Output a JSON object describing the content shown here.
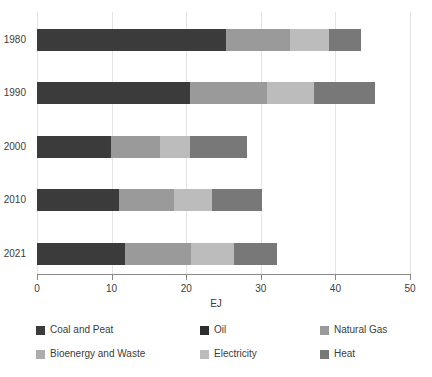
{
  "chart_data": {
    "type": "bar",
    "orientation": "horizontal",
    "stacked": true,
    "title": "",
    "xlabel": "EJ",
    "ylabel": "",
    "xlim": [
      0,
      50
    ],
    "xticks": [
      0,
      10,
      20,
      30,
      40,
      50
    ],
    "xtick_labels": [
      "0",
      "10",
      "20",
      "30",
      "40",
      "50"
    ],
    "categories": [
      "1980",
      "1990",
      "2000",
      "2010",
      "2021"
    ],
    "grid": "vertical",
    "legend_position": "bottom",
    "series": [
      {
        "name": "Coal and Peat",
        "color": "#3b3b3b",
        "values": [
          25.4,
          20.5,
          9.9,
          11.0,
          11.8
        ]
      },
      {
        "name": "Oil",
        "color": "#2e2e2e",
        "values": [
          0.0,
          0.0,
          0.0,
          0.0,
          0.0
        ]
      },
      {
        "name": "Natural Gas",
        "color": "#9a9a9a",
        "values": [
          8.5,
          10.3,
          6.6,
          7.4,
          8.8
        ]
      },
      {
        "name": "Bioenergy and Waste",
        "color": "#adadad",
        "values": [
          0.0,
          0.0,
          0.0,
          0.0,
          0.0
        ]
      },
      {
        "name": "Electricity",
        "color": "#bcbcbc",
        "values": [
          5.2,
          6.3,
          4.0,
          5.1,
          5.8
        ]
      },
      {
        "name": "Heat",
        "color": "#787878",
        "values": [
          4.3,
          8.2,
          7.6,
          6.6,
          5.8
        ]
      }
    ],
    "totals": [
      43.4,
      45.3,
      28.1,
      30.1,
      32.2
    ]
  },
  "legend": {
    "entries": [
      {
        "label": "Coal and Peat",
        "color": "#3b3b3b"
      },
      {
        "label": "Oil",
        "color": "#2e2e2e"
      },
      {
        "label": "Natural Gas",
        "color": "#9a9a9a"
      },
      {
        "label": "Bioenergy and Waste",
        "color": "#adadad"
      },
      {
        "label": "Electricity",
        "color": "#bcbcbc"
      },
      {
        "label": "Heat",
        "color": "#787878"
      }
    ]
  },
  "axis": {
    "x_title": "EJ"
  }
}
